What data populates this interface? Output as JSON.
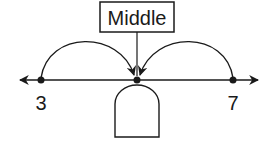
{
  "diagram": {
    "title_box": {
      "label": "Middle"
    },
    "number_line": {
      "points": [
        {
          "label": "3",
          "x": 41
        },
        {
          "label": "",
          "x": 137
        },
        {
          "label": "7",
          "x": 233
        }
      ]
    },
    "answer_box": {
      "value": ""
    },
    "colors": {
      "stroke": "#1a1a1a",
      "background": "#ffffff"
    }
  }
}
